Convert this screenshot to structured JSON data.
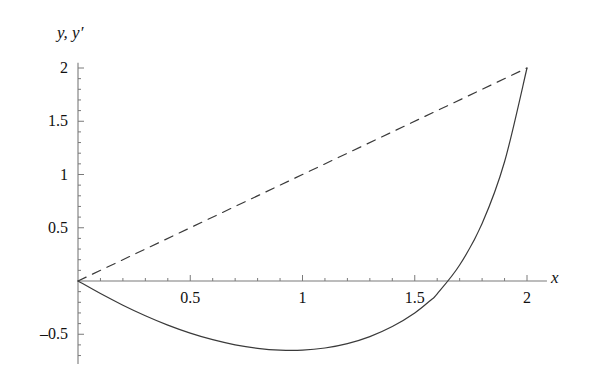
{
  "figure": {
    "background_color": "#ffffff",
    "axis_color": "#7a7a7a",
    "curve_color": "#3a3a3a"
  },
  "labels": {
    "y_axis_label": "y, y′",
    "x_axis_label": "x"
  },
  "chart_data": {
    "type": "line",
    "title": "",
    "xlabel": "x",
    "ylabel": "y, y′",
    "grid": false,
    "legend": "none",
    "xlim": [
      0,
      2.08
    ],
    "ylim": [
      -0.78,
      2.05
    ],
    "x_ticks_major": [
      0.5,
      1,
      1.5,
      2
    ],
    "x_tick_labels": [
      "0.5",
      "1",
      "1.5",
      "2"
    ],
    "x_minor_tick_step": 0.1,
    "y_ticks_major": [
      -0.5,
      0.5,
      1,
      1.5,
      2
    ],
    "y_tick_labels": [
      "–0.5",
      "0.5",
      "1",
      "1.5",
      "2"
    ],
    "y_minor_tick_step": 0.1,
    "series": [
      {
        "name": "y",
        "style": "solid",
        "color": "#3a3a3a",
        "x": [
          0,
          0.1,
          0.2,
          0.3,
          0.4,
          0.5,
          0.6,
          0.7,
          0.8,
          0.9,
          1.0,
          1.1,
          1.2,
          1.3,
          1.4,
          1.5,
          1.571,
          1.6,
          1.7,
          1.8,
          1.9,
          2.0
        ],
        "y": [
          0,
          -0.118,
          -0.227,
          -0.326,
          -0.414,
          -0.489,
          -0.551,
          -0.599,
          -0.632,
          -0.649,
          -0.649,
          -0.629,
          -0.588,
          -0.522,
          -0.428,
          -0.3,
          -0.18,
          -0.12,
          0.15,
          0.54,
          1.12,
          2.0
        ]
      },
      {
        "name": "y′",
        "style": "dashed",
        "color": "#3a3a3a",
        "x": [
          0,
          2.0
        ],
        "y": [
          0,
          2.0
        ]
      }
    ],
    "annotations": {
      "minimum_point": {
        "x": 0.95,
        "y": -0.65
      },
      "zero_crossing": {
        "x": 1.57,
        "y": 0
      },
      "endpoint": {
        "x": 2.0,
        "y": 2.0
      }
    }
  }
}
